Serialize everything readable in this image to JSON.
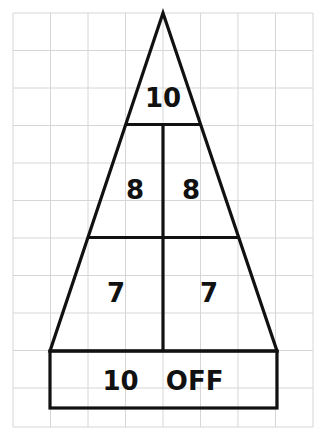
{
  "diagram": {
    "grid": {
      "x_lines": [
        13,
        50.5,
        88,
        125.5,
        163,
        200.5,
        238,
        275.5,
        313
      ],
      "y_lines": [
        13,
        50.5,
        88,
        125.5,
        163,
        200.5,
        238,
        275.5,
        313,
        350.5,
        388,
        427
      ],
      "color": "#d6d6d6"
    },
    "stroke_color": "#111111",
    "zones": [
      {
        "id": "top",
        "label": "10"
      },
      {
        "id": "middle-left",
        "label": "8"
      },
      {
        "id": "middle-right",
        "label": "8"
      },
      {
        "id": "bottom-left",
        "label": "7"
      },
      {
        "id": "bottom-right",
        "label": "7"
      },
      {
        "id": "off-zone",
        "label": "10   OFF"
      }
    ]
  }
}
